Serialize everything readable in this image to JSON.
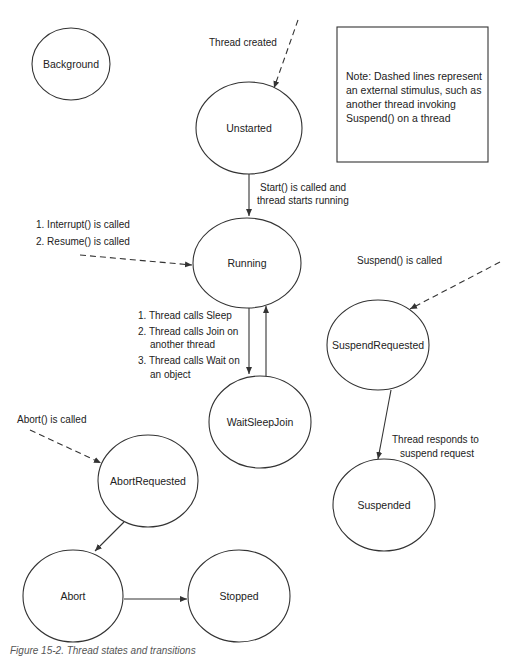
{
  "diagram": {
    "title": "Thread states and transitions",
    "states": {
      "background": "Background",
      "unstarted": "Unstarted",
      "running": "Running",
      "wait_sleep_join": "WaitSleepJoin",
      "suspend_requested": "SuspendRequested",
      "suspended": "Suspended",
      "abort_requested": "AbortRequested",
      "abort": "Abort",
      "stopped": "Stopped"
    },
    "labels": {
      "thread_created": "Thread created",
      "start": [
        "Start() is called and",
        "thread starts running"
      ],
      "interrupt_resume": [
        "1. Interrupt() is called",
        "2. Resume() is called"
      ],
      "wait_reasons": [
        "1. Thread calls Sleep",
        "2. Thread calls Join on",
        "another thread",
        "3. Thread calls Wait on",
        "an object"
      ],
      "suspend_called": "Suspend() is called",
      "responds": [
        "Thread responds to",
        "suspend request"
      ],
      "abort_called": "Abort() is called"
    },
    "note": [
      "Note: Dashed lines represent",
      "an external stimulus, such as",
      "another thread invoking",
      "Suspend() on a thread"
    ],
    "caption": "Figure 15-2. Thread states and transitions"
  }
}
